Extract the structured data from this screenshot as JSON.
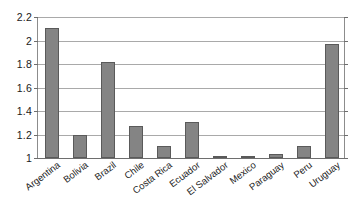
{
  "chart_data": {
    "type": "bar",
    "title": "",
    "subtitle": "",
    "xlabel": "",
    "ylabel": "",
    "categories": [
      "Argentina",
      "Bolivia",
      "Brazil",
      "Chile",
      "Costa Rica",
      "Ecuador",
      "El Salvador",
      "Mexico",
      "Paraguay",
      "Peru",
      "Uruguay"
    ],
    "values": [
      2.11,
      1.2,
      1.82,
      1.27,
      1.1,
      1.31,
      1.005,
      1.005,
      1.03,
      1.1,
      1.97
    ],
    "ylim": [
      1,
      2.2
    ],
    "ytick_labels": [
      "2.2",
      "2",
      "1.8",
      "1.6",
      "1.4",
      "1.2",
      "1"
    ],
    "ytick_values": [
      2.2,
      2.0,
      1.8,
      1.6,
      1.4,
      1.2,
      1.0
    ],
    "grid": true,
    "legend": false,
    "legend_position": "none",
    "bar_color": "#848484",
    "bar_border_color": "#5a5a5a",
    "gridline_color": "#a9a9a9",
    "axis_color": "#6e6e6e",
    "background_color": "#ffffff"
  }
}
